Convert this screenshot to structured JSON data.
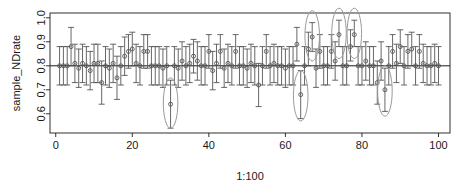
{
  "chart_data": {
    "type": "scatter",
    "title": "",
    "subtitle": "",
    "xlabel": "1:100",
    "ylabel": "sample_NDrate",
    "xlim": [
      -1.5,
      103
    ],
    "ylim": [
      0.52,
      1.02
    ],
    "grid": false,
    "legend": null,
    "x_ticks": [
      0,
      20,
      40,
      60,
      80,
      100
    ],
    "x_tick_labels": [
      "0",
      "20",
      "40",
      "60",
      "80",
      "100"
    ],
    "y_ticks": [
      0.6,
      0.7,
      0.8,
      0.9,
      1.0
    ],
    "y_tick_labels": [
      "0.6",
      "0.7",
      "0.8",
      "0.9",
      "1.0"
    ],
    "reference_line": {
      "orientation": "horizontal",
      "value": 0.8,
      "color": "#1a1a1a"
    },
    "point_marker": "open-circle",
    "error_bar_style": "capped-vertical",
    "series": [
      {
        "name": "confidence intervals",
        "color": "#4d4d4d",
        "x": [
          1,
          2,
          3,
          4,
          5,
          6,
          7,
          8,
          9,
          10,
          11,
          12,
          13,
          14,
          15,
          16,
          17,
          18,
          19,
          20,
          21,
          22,
          23,
          24,
          25,
          26,
          27,
          28,
          29,
          30,
          31,
          32,
          33,
          34,
          35,
          36,
          37,
          38,
          39,
          40,
          41,
          42,
          43,
          44,
          45,
          46,
          47,
          48,
          49,
          50,
          51,
          52,
          53,
          54,
          55,
          56,
          57,
          58,
          59,
          60,
          61,
          62,
          63,
          64,
          65,
          66,
          67,
          68,
          69,
          70,
          71,
          72,
          73,
          74,
          75,
          76,
          77,
          78,
          79,
          80,
          81,
          82,
          83,
          84,
          85,
          86,
          87,
          88,
          89,
          90,
          91,
          92,
          93,
          94,
          95,
          96,
          97,
          98,
          99,
          100
        ],
        "values": [
          0.8,
          0.8,
          0.8,
          0.88,
          0.81,
          0.79,
          0.81,
          0.8,
          0.78,
          0.81,
          0.81,
          0.73,
          0.8,
          0.79,
          0.81,
          0.75,
          0.8,
          0.84,
          0.86,
          0.87,
          0.81,
          0.8,
          0.86,
          0.86,
          0.8,
          0.8,
          0.8,
          0.79,
          0.8,
          0.64,
          0.8,
          0.79,
          0.82,
          0.8,
          0.81,
          0.84,
          0.82,
          0.8,
          0.8,
          0.86,
          0.78,
          0.81,
          0.86,
          0.79,
          0.81,
          0.8,
          0.86,
          0.8,
          0.8,
          0.79,
          0.81,
          0.8,
          0.72,
          0.8,
          0.86,
          0.8,
          0.81,
          0.8,
          0.8,
          0.79,
          0.8,
          0.8,
          0.89,
          0.68,
          0.8,
          0.87,
          0.92,
          0.79,
          0.86,
          0.8,
          0.8,
          0.86,
          0.82,
          0.93,
          0.8,
          0.8,
          0.88,
          0.93,
          0.8,
          0.8,
          0.82,
          0.8,
          0.8,
          0.73,
          0.82,
          0.7,
          0.8,
          0.86,
          0.81,
          0.88,
          0.8,
          0.86,
          0.87,
          0.8,
          0.86,
          0.81,
          0.8,
          0.8,
          0.81,
          0.8
        ],
        "lower": [
          0.72,
          0.72,
          0.72,
          0.8,
          0.73,
          0.71,
          0.73,
          0.72,
          0.7,
          0.73,
          0.73,
          0.64,
          0.72,
          0.71,
          0.73,
          0.66,
          0.72,
          0.76,
          0.79,
          0.8,
          0.73,
          0.72,
          0.79,
          0.79,
          0.72,
          0.72,
          0.72,
          0.71,
          0.72,
          0.54,
          0.72,
          0.71,
          0.74,
          0.72,
          0.73,
          0.77,
          0.74,
          0.72,
          0.72,
          0.79,
          0.7,
          0.73,
          0.79,
          0.71,
          0.73,
          0.72,
          0.79,
          0.72,
          0.72,
          0.71,
          0.73,
          0.72,
          0.63,
          0.72,
          0.79,
          0.72,
          0.73,
          0.72,
          0.72,
          0.71,
          0.72,
          0.72,
          0.82,
          0.58,
          0.72,
          0.8,
          0.86,
          0.71,
          0.79,
          0.72,
          0.72,
          0.79,
          0.74,
          0.88,
          0.72,
          0.72,
          0.82,
          0.88,
          0.72,
          0.72,
          0.74,
          0.72,
          0.72,
          0.64,
          0.74,
          0.61,
          0.72,
          0.79,
          0.73,
          0.81,
          0.72,
          0.79,
          0.8,
          0.72,
          0.79,
          0.73,
          0.72,
          0.72,
          0.73,
          0.72
        ],
        "upper": [
          0.88,
          0.88,
          0.88,
          0.96,
          0.89,
          0.87,
          0.89,
          0.88,
          0.86,
          0.89,
          0.89,
          0.82,
          0.88,
          0.87,
          0.89,
          0.84,
          0.88,
          0.92,
          0.93,
          0.94,
          0.89,
          0.88,
          0.93,
          0.93,
          0.88,
          0.88,
          0.88,
          0.87,
          0.88,
          0.74,
          0.88,
          0.87,
          0.9,
          0.88,
          0.89,
          0.91,
          0.9,
          0.88,
          0.88,
          0.93,
          0.86,
          0.89,
          0.93,
          0.87,
          0.89,
          0.88,
          0.93,
          0.88,
          0.88,
          0.87,
          0.89,
          0.88,
          0.81,
          0.88,
          0.93,
          0.88,
          0.89,
          0.88,
          0.88,
          0.87,
          0.88,
          0.88,
          0.96,
          0.78,
          0.88,
          0.94,
          0.98,
          0.87,
          0.93,
          0.88,
          0.88,
          0.93,
          0.9,
          0.99,
          0.88,
          0.88,
          0.95,
          0.99,
          0.88,
          0.88,
          0.9,
          0.88,
          0.88,
          0.82,
          0.9,
          0.79,
          0.88,
          0.93,
          0.89,
          0.95,
          0.88,
          0.93,
          0.94,
          0.88,
          0.93,
          0.89,
          0.88,
          0.88,
          0.89,
          0.88
        ]
      }
    ],
    "annotations": [
      {
        "name": "highlight-ellipse-1",
        "x": 30,
        "y_center": 0.645,
        "rx": 1.9,
        "ry": 0.105,
        "shape": "ellipse",
        "color": "#9a9a9a"
      },
      {
        "name": "highlight-ellipse-2",
        "x": 64,
        "y_center": 0.675,
        "rx": 1.9,
        "ry": 0.105,
        "shape": "ellipse",
        "color": "#9a9a9a"
      },
      {
        "name": "highlight-ellipse-3",
        "x": 86,
        "y_center": 0.695,
        "rx": 1.9,
        "ry": 0.105,
        "shape": "ellipse",
        "color": "#9a9a9a"
      },
      {
        "name": "highlight-ellipse-4",
        "x": 67,
        "y_center": 0.925,
        "rx": 1.9,
        "ry": 0.105,
        "shape": "ellipse",
        "color": "#9a9a9a"
      },
      {
        "name": "highlight-ellipse-5",
        "x": 74,
        "y_center": 0.935,
        "rx": 1.9,
        "ry": 0.105,
        "shape": "ellipse",
        "color": "#9a9a9a"
      },
      {
        "name": "highlight-ellipse-6",
        "x": 78,
        "y_center": 0.935,
        "rx": 1.9,
        "ry": 0.105,
        "shape": "ellipse",
        "color": "#9a9a9a"
      }
    ]
  }
}
